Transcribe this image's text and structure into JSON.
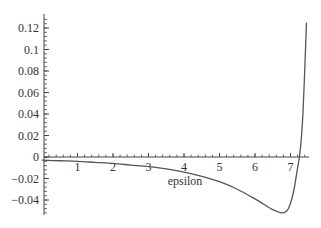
{
  "chart_data": {
    "type": "line",
    "title": "",
    "xlabel": "epsilon",
    "ylabel": "",
    "xlim": [
      0,
      7.5
    ],
    "ylim": [
      -0.055,
      0.13
    ],
    "grid": false,
    "legend": null,
    "x_ticks": [
      1,
      2,
      3,
      4,
      5,
      6,
      7
    ],
    "x_tick_labels": [
      "1",
      "2",
      "3",
      "4",
      "5",
      "6",
      "7"
    ],
    "y_ticks": [
      -0.04,
      -0.02,
      0,
      0.02,
      0.04,
      0.06,
      0.08,
      0.1,
      0.12
    ],
    "y_tick_labels": [
      "-0.04",
      "-0.02",
      "0",
      "0.02",
      "0.04",
      "0.06",
      "0.08",
      "0.1",
      "0.12"
    ],
    "series": [
      {
        "name": "curve",
        "color": "#555555",
        "x": [
          0,
          0.5,
          1,
          1.5,
          2,
          2.5,
          3,
          3.5,
          4,
          4.5,
          5,
          5.5,
          6,
          6.25,
          6.5,
          6.75,
          6.9,
          7.0,
          7.1,
          7.2,
          7.25,
          7.3,
          7.35,
          7.4,
          7.45
        ],
        "y": [
          -0.003,
          -0.0035,
          -0.004,
          -0.005,
          -0.006,
          -0.0075,
          -0.009,
          -0.011,
          -0.014,
          -0.018,
          -0.023,
          -0.03,
          -0.039,
          -0.044,
          -0.049,
          -0.052,
          -0.05,
          -0.043,
          -0.03,
          -0.01,
          0.0,
          0.015,
          0.04,
          0.08,
          0.125
        ]
      }
    ]
  }
}
